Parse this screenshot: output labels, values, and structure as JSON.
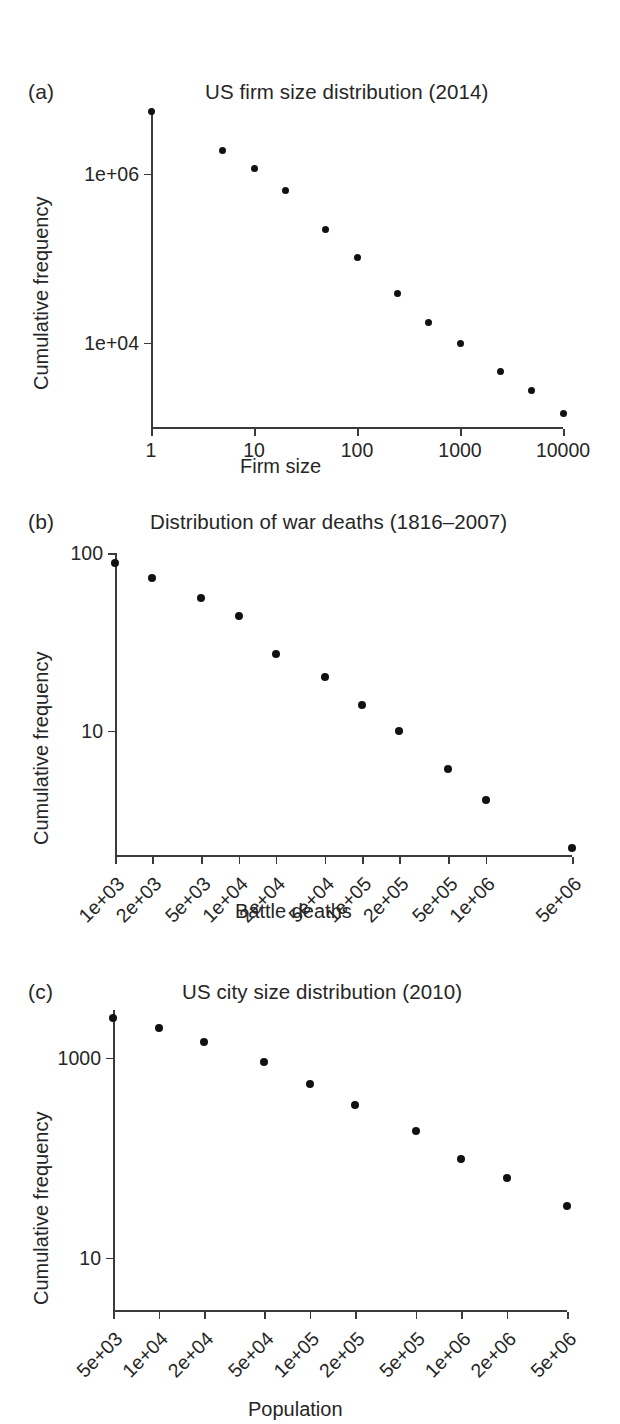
{
  "figure": {
    "panels": [
      {
        "letter": "(a)",
        "title": "US firm size distribution (2014)",
        "ylabel": "Cumulative frequency",
        "xlabel": "Firm size"
      },
      {
        "letter": "(b)",
        "title": "Distribution of war deaths (1816–2007)",
        "ylabel": "Cumulative frequency",
        "xlabel": "Battle deaths"
      },
      {
        "letter": "(c)",
        "title": "US city size distribution (2010)",
        "ylabel": "Cumulative frequency",
        "xlabel": "Population"
      }
    ]
  },
  "chart_data": [
    {
      "type": "scatter",
      "panel": "a",
      "title": "US firm size distribution (2014)",
      "xlabel": "Firm size",
      "ylabel": "Cumulative frequency",
      "xscale": "log",
      "yscale": "log",
      "xlim": [
        1,
        10000
      ],
      "ylim": [
        1000,
        6000000
      ],
      "grid": false,
      "legend": null,
      "xticks": [
        1,
        10,
        100,
        1000,
        10000
      ],
      "xticklabels": [
        "1",
        "10",
        "100",
        "1000",
        "10000"
      ],
      "yticks": [
        10000,
        1000000
      ],
      "yticklabels": [
        "1e+04",
        "1e+06"
      ],
      "x": [
        1,
        5,
        10,
        20,
        50,
        100,
        250,
        500,
        1000,
        2500,
        5000,
        10000
      ],
      "y": [
        5400000,
        1900000,
        1150000,
        640000,
        220000,
        103000,
        38000,
        17500,
        9800,
        4500,
        2700,
        1450
      ],
      "marker": "filled-circle",
      "color": "#111111"
    },
    {
      "type": "scatter",
      "panel": "b",
      "title": "Distribution of war deaths (1816–2007)",
      "xlabel": "Battle deaths",
      "ylabel": "Cumulative frequency",
      "xscale": "log",
      "yscale": "log",
      "xlim": [
        1000,
        5000000
      ],
      "ylim": [
        2,
        100
      ],
      "grid": false,
      "legend": null,
      "xticks": [
        1000,
        2000,
        5000,
        10000,
        20000,
        50000,
        100000,
        200000,
        500000,
        1000000,
        5000000
      ],
      "xticklabels": [
        "1e+03",
        "2e+03",
        "5e+03",
        "1e+04",
        "2e+04",
        "5e+04",
        "1e+05",
        "2e+05",
        "5e+05",
        "1e+06",
        "5e+06"
      ],
      "yticks": [
        10,
        100
      ],
      "yticklabels": [
        "10",
        "100"
      ],
      "x": [
        1000,
        2000,
        5000,
        10000,
        20000,
        50000,
        100000,
        200000,
        500000,
        1000000,
        5000000
      ],
      "y": [
        88,
        72,
        56,
        44,
        27,
        20,
        14,
        10,
        6.1,
        4.1,
        2.2
      ],
      "marker": "filled-circle",
      "color": "#111111"
    },
    {
      "type": "scatter",
      "panel": "c",
      "title": "US city size distribution (2010)",
      "xlabel": "Population",
      "ylabel": "Cumulative frequency",
      "xscale": "log",
      "yscale": "log",
      "xlim": [
        5000,
        5000000
      ],
      "ylim": [
        3,
        3000
      ],
      "grid": false,
      "legend": null,
      "xticks": [
        5000,
        10000,
        20000,
        50000,
        100000,
        200000,
        500000,
        1000000,
        2000000,
        5000000
      ],
      "xticklabels": [
        "5e+03",
        "1e+04",
        "2e+04",
        "5e+04",
        "1e+05",
        "2e+05",
        "5e+05",
        "1e+06",
        "2e+06",
        "5e+06"
      ],
      "yticks": [
        10,
        1000
      ],
      "yticklabels": [
        "10",
        "1000"
      ],
      "x": [
        5000,
        10000,
        20000,
        50000,
        100000,
        200000,
        500000,
        1000000,
        2000000,
        5000000
      ],
      "y": [
        2500,
        2000,
        1450,
        900,
        540,
        340,
        185,
        96,
        62,
        33
      ],
      "marker": "filled-circle",
      "color": "#111111"
    }
  ]
}
